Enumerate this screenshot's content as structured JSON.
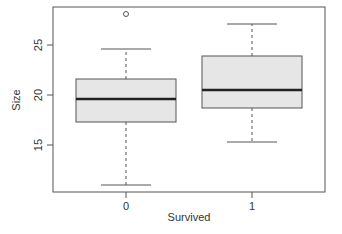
{
  "chart_data": {
    "type": "boxplot",
    "title": "",
    "xlabel": "Survived",
    "ylabel": "Size",
    "categories": [
      "0",
      "1"
    ],
    "yticks": [
      15,
      20,
      25
    ],
    "ylim": [
      9.8,
      28.8
    ],
    "grid": false,
    "legend": null,
    "series": [
      {
        "name": "0",
        "whisker_low": 11.0,
        "q1": 17.3,
        "median": 19.6,
        "q3": 21.6,
        "whisker_high": 24.6,
        "outliers": [
          28.1
        ]
      },
      {
        "name": "1",
        "whisker_low": 15.3,
        "q1": 18.7,
        "median": 20.5,
        "q3": 23.9,
        "whisker_high": 27.1,
        "outliers": []
      }
    ],
    "colors": {
      "box_fill": "#e6e6e6",
      "box_border": "#555555",
      "median": "#222222",
      "whisker": "#555555",
      "axis": "#555555",
      "text": "#333333"
    }
  }
}
